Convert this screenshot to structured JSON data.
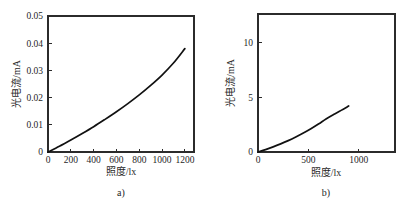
{
  "figure": {
    "background_color": "#ffffff",
    "curve_color": "#111111",
    "axis_color": "#2b2b2b"
  },
  "chart_data": [
    {
      "type": "line",
      "panel_id": "a",
      "caption": "a)",
      "title": "",
      "xlabel": "照度/lx",
      "ylabel": "光电流/mA",
      "xlim": [
        0,
        1280
      ],
      "ylim": [
        0,
        0.05
      ],
      "grid": false,
      "legend": "none",
      "xticks": [
        0,
        200,
        400,
        600,
        800,
        1000,
        1200
      ],
      "xticklabels": [
        "0",
        "200",
        "400",
        "600",
        "800",
        "1000",
        "1200"
      ],
      "yticks": [
        0,
        0.01,
        0.02,
        0.03,
        0.04,
        0.05
      ],
      "yticklabels": [
        "0",
        "0.01",
        "0.02",
        "0.03",
        "0.04",
        "0.05"
      ],
      "series": [
        {
          "name": "photocurrent-a",
          "x": [
            0,
            100,
            200,
            300,
            400,
            500,
            600,
            700,
            800,
            900,
            1000,
            1100,
            1200
          ],
          "y": [
            0.0,
            0.0021,
            0.0044,
            0.0068,
            0.0093,
            0.012,
            0.0148,
            0.0178,
            0.021,
            0.0245,
            0.0283,
            0.0327,
            0.038
          ]
        }
      ]
    },
    {
      "type": "line",
      "panel_id": "b",
      "caption": "b)",
      "title": "",
      "xlabel": "照度/lx",
      "ylabel": "光电流/mA",
      "xlim": [
        0,
        1360
      ],
      "ylim": [
        0,
        12.6
      ],
      "grid": false,
      "legend": "none",
      "xticks": [
        0,
        500,
        1000
      ],
      "xticklabels": [
        "0",
        "500",
        "1000"
      ],
      "yticks": [
        0,
        5,
        10
      ],
      "yticklabels": [
        "0",
        "5",
        "10"
      ],
      "series": [
        {
          "name": "photocurrent-b",
          "x": [
            0,
            75,
            150,
            225,
            300,
            375,
            450,
            525,
            600,
            675,
            750,
            825,
            900
          ],
          "y": [
            0.0,
            0.22,
            0.47,
            0.74,
            1.04,
            1.37,
            1.73,
            2.12,
            2.55,
            3.02,
            3.42,
            3.8,
            4.2
          ]
        }
      ]
    }
  ]
}
